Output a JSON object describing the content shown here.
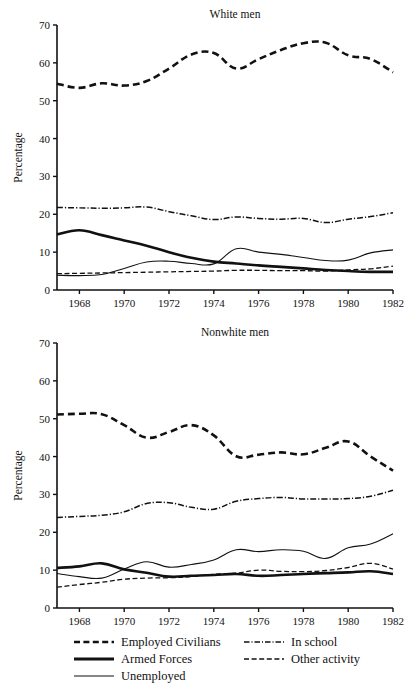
{
  "figure": {
    "background": "#ffffff",
    "ink": "#111111"
  },
  "legend": {
    "items": [
      {
        "label": "Employed Civilians",
        "key": "employed_civilians",
        "style": "dashed-thick",
        "column": "left"
      },
      {
        "label": "Armed Forces",
        "key": "armed_forces",
        "style": "solid-thick",
        "column": "left"
      },
      {
        "label": "Unemployed",
        "key": "unemployed",
        "style": "solid-thin",
        "column": "left"
      },
      {
        "label": "In school",
        "key": "in_school",
        "style": "dash-dot",
        "column": "right"
      },
      {
        "label": "Other activity",
        "key": "other_activity",
        "style": "dashed-thin",
        "column": "right"
      }
    ]
  },
  "chart_data": [
    {
      "type": "line",
      "title": "White men",
      "xlabel": "",
      "ylabel": "Percentage",
      "xlim": [
        1967,
        1982
      ],
      "ylim": [
        0,
        70
      ],
      "yticks": [
        0,
        10,
        20,
        30,
        40,
        50,
        60,
        70
      ],
      "xticks": [
        1968,
        1970,
        1972,
        1974,
        1976,
        1978,
        1980,
        1982
      ],
      "xticklabels": [
        "1968",
        "1970",
        "1972",
        "1974",
        "1976",
        "1978",
        "1980",
        "1982"
      ],
      "yticklabels": [
        "0",
        "10",
        "20",
        "30",
        "40",
        "50",
        "60",
        "70"
      ],
      "grid": false,
      "legend_position": "below-figure",
      "x": [
        1967,
        1968,
        1969,
        1970,
        1971,
        1972,
        1973,
        1974,
        1975,
        1976,
        1977,
        1978,
        1979,
        1980,
        1981,
        1982
      ],
      "series": [
        {
          "name": "Employed Civilians",
          "style": "dashed-thick",
          "values": [
            54.5,
            53.4,
            54.6,
            54.0,
            55.2,
            58.5,
            62.2,
            62.6,
            58.5,
            61.0,
            63.4,
            65.2,
            65.3,
            62.0,
            61.0,
            57.5
          ]
        },
        {
          "name": "In school",
          "style": "dash-dot",
          "values": [
            21.8,
            21.7,
            21.6,
            21.7,
            21.9,
            20.7,
            19.6,
            18.6,
            19.3,
            18.9,
            18.7,
            18.9,
            17.8,
            18.7,
            19.4,
            20.4
          ]
        },
        {
          "name": "Armed Forces",
          "style": "solid-thick",
          "values": [
            14.7,
            15.8,
            14.5,
            13.1,
            11.7,
            10.0,
            8.5,
            7.5,
            7.0,
            6.5,
            6.1,
            5.7,
            5.3,
            5.0,
            4.8,
            4.8
          ]
        },
        {
          "name": "Unemployed",
          "style": "solid-thin",
          "values": [
            3.9,
            3.8,
            4.1,
            5.7,
            7.4,
            7.6,
            7.0,
            6.9,
            10.9,
            10.0,
            9.4,
            8.6,
            7.8,
            7.9,
            9.8,
            10.6,
            12.6
          ]
        },
        {
          "name": "Other activity",
          "style": "dashed-thin",
          "values": [
            4.3,
            4.4,
            4.5,
            4.6,
            4.7,
            4.8,
            4.9,
            5.0,
            5.2,
            5.2,
            5.1,
            5.1,
            5.0,
            5.3,
            5.6,
            6.3
          ]
        }
      ]
    },
    {
      "type": "line",
      "title": "Nonwhite men",
      "xlabel": "",
      "ylabel": "Percentage",
      "xlim": [
        1967,
        1982
      ],
      "ylim": [
        0,
        70
      ],
      "yticks": [
        0,
        10,
        20,
        30,
        40,
        50,
        60,
        70
      ],
      "xticks": [
        1968,
        1970,
        1972,
        1974,
        1976,
        1978,
        1980,
        1982
      ],
      "xticklabels": [
        "1968",
        "1970",
        "1972",
        "1974",
        "1976",
        "1978",
        "1980",
        "1982"
      ],
      "yticklabels": [
        "0",
        "10",
        "20",
        "30",
        "40",
        "50",
        "60",
        "70"
      ],
      "grid": false,
      "legend_position": "below-figure",
      "x": [
        1967,
        1968,
        1969,
        1970,
        1971,
        1972,
        1973,
        1974,
        1975,
        1976,
        1977,
        1978,
        1979,
        1980,
        1981,
        1982
      ],
      "series": [
        {
          "name": "Employed Civilians",
          "style": "dashed-thick",
          "values": [
            51.1,
            51.3,
            51.2,
            48.3,
            45.0,
            46.5,
            48.3,
            45.6,
            40.1,
            40.5,
            41.1,
            40.6,
            42.3,
            44.0,
            40.0,
            36.3
          ]
        },
        {
          "name": "In school",
          "style": "dash-dot",
          "values": [
            23.9,
            24.2,
            24.5,
            25.4,
            27.6,
            27.8,
            26.6,
            26.1,
            28.2,
            28.9,
            29.2,
            28.8,
            28.8,
            28.9,
            29.5,
            31.1
          ]
        },
        {
          "name": "Unemployed",
          "style": "solid-thin",
          "values": [
            9.1,
            8.3,
            7.9,
            10.3,
            12.2,
            10.8,
            11.5,
            12.7,
            15.4,
            14.9,
            15.4,
            15.0,
            13.1,
            15.9,
            16.9,
            19.6
          ]
        },
        {
          "name": "Armed Forces",
          "style": "solid-thick",
          "values": [
            10.6,
            11.0,
            11.8,
            10.2,
            9.3,
            8.3,
            8.5,
            8.7,
            9.0,
            8.5,
            8.7,
            9.0,
            9.2,
            9.4,
            9.7,
            9.0
          ]
        },
        {
          "name": "Other activity",
          "style": "dashed-thin",
          "values": [
            5.5,
            6.2,
            6.8,
            7.6,
            7.9,
            8.0,
            8.3,
            8.9,
            9.2,
            10.0,
            9.7,
            9.6,
            9.9,
            10.7,
            11.8,
            10.3
          ]
        }
      ]
    }
  ]
}
